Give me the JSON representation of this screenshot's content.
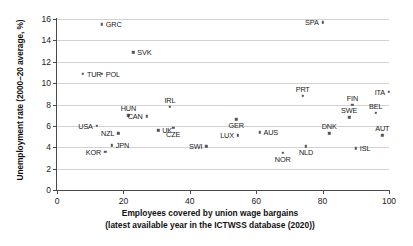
{
  "chart_data": {
    "type": "scatter",
    "title": "",
    "xlabel": "Employees covered by union wage bargains",
    "xlabel_line2": "(latest available year in the ICTWSS database (2020))",
    "ylabel": "Unemployment rate (2000–20 average, %)",
    "xlim": [
      0,
      100
    ],
    "ylim": [
      0,
      16
    ],
    "xticks": [
      0,
      20,
      40,
      60,
      80,
      100
    ],
    "yticks": [
      0,
      2,
      4,
      6,
      8,
      10,
      12,
      14,
      16
    ],
    "grid": "horizontal",
    "legend": "none",
    "marker_color": "#555555",
    "grid_color": "#d2d2d2",
    "axis_color": "#4a4a4a",
    "points": [
      {
        "label": "GRC",
        "x": 13.5,
        "y": 15.5,
        "pos": "right"
      },
      {
        "label": "SPA",
        "x": 80.0,
        "y": 15.7,
        "pos": "left"
      },
      {
        "label": "SVK",
        "x": 23.0,
        "y": 12.9,
        "pos": "right"
      },
      {
        "label": "TUR",
        "x": 7.8,
        "y": 10.9,
        "pos": "right"
      },
      {
        "label": "POL",
        "x": 13.5,
        "y": 10.9,
        "pos": "right"
      },
      {
        "label": "ITA",
        "x": 100.0,
        "y": 9.2,
        "pos": "left"
      },
      {
        "label": "PRT",
        "x": 74.0,
        "y": 8.8,
        "pos": "above"
      },
      {
        "label": "FIN",
        "x": 89.0,
        "y": 8.0,
        "pos": "above"
      },
      {
        "label": "IRL",
        "x": 34.0,
        "y": 7.8,
        "pos": "above"
      },
      {
        "label": "BEL",
        "x": 96.0,
        "y": 7.2,
        "pos": "above"
      },
      {
        "label": "HUN",
        "x": 21.5,
        "y": 7.0,
        "pos": "above"
      },
      {
        "label": "CAN",
        "x": 27.0,
        "y": 6.9,
        "pos": "left"
      },
      {
        "label": "SWE",
        "x": 88.0,
        "y": 6.8,
        "pos": "above"
      },
      {
        "label": "GER",
        "x": 54.0,
        "y": 6.6,
        "pos": "below"
      },
      {
        "label": "USA",
        "x": 12.0,
        "y": 6.0,
        "pos": "left"
      },
      {
        "label": "CZE",
        "x": 35.0,
        "y": 5.8,
        "pos": "below"
      },
      {
        "label": "UK",
        "x": 30.5,
        "y": 5.6,
        "pos": "right"
      },
      {
        "label": "AUS",
        "x": 61.0,
        "y": 5.4,
        "pos": "right"
      },
      {
        "label": "NZL",
        "x": 18.5,
        "y": 5.3,
        "pos": "left"
      },
      {
        "label": "DNK",
        "x": 82.0,
        "y": 5.3,
        "pos": "above"
      },
      {
        "label": "LUX",
        "x": 54.5,
        "y": 5.1,
        "pos": "left"
      },
      {
        "label": "AUT",
        "x": 98.0,
        "y": 5.1,
        "pos": "above"
      },
      {
        "label": "JPN",
        "x": 16.5,
        "y": 4.2,
        "pos": "right"
      },
      {
        "label": "SWI",
        "x": 45.0,
        "y": 4.1,
        "pos": "left"
      },
      {
        "label": "NLD",
        "x": 75.0,
        "y": 4.1,
        "pos": "below"
      },
      {
        "label": "ISL",
        "x": 90.0,
        "y": 3.9,
        "pos": "right"
      },
      {
        "label": "KOR",
        "x": 14.5,
        "y": 3.6,
        "pos": "left"
      },
      {
        "label": "NOR",
        "x": 68.0,
        "y": 3.5,
        "pos": "below"
      }
    ]
  }
}
